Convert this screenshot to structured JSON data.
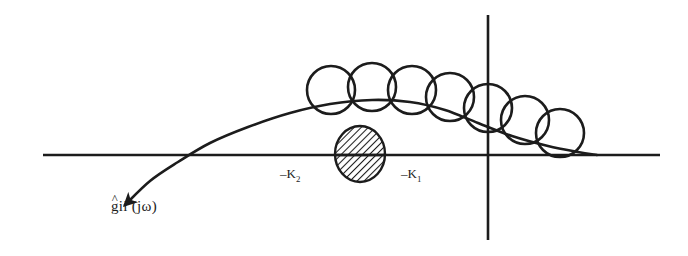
{
  "figure": {
    "background_color": "#ffffff",
    "ink_color": "#1c1c1c",
    "width": 688,
    "height": 256
  },
  "labels": {
    "response_curve": {
      "full_text": "ĝii (jω)",
      "hat": "^",
      "base": "g",
      "indices": "ii",
      "argument": " (jω)"
    },
    "gain_lower": {
      "full_text": "−K₂",
      "minus": "–",
      "symbol": "K",
      "subscript": "2"
    },
    "gain_upper": {
      "full_text": "−K₁",
      "minus": "–",
      "symbol": "K",
      "subscript": "1"
    }
  },
  "axes": {
    "horizontal": {
      "name": "real-axis",
      "x1": 43,
      "y1": 155,
      "x2": 660,
      "y2": 155,
      "stroke_width": 2.6
    },
    "vertical": {
      "name": "imaginary-axis",
      "x1": 488,
      "y1": 15,
      "x2": 488,
      "y2": 240,
      "stroke_width": 2.6
    }
  },
  "chart_data": {
    "type": "line",
    "title": "",
    "xlabel": "",
    "ylabel": "",
    "grid": false,
    "legend": "none",
    "response_curve": {
      "name": "ghat-ii-jomega",
      "stroke_width": 2.6,
      "arrow_end": "start",
      "points": [
        [
          125,
          205
        ],
        [
          150,
          181
        ],
        [
          178,
          162
        ],
        [
          210,
          143
        ],
        [
          248,
          127
        ],
        [
          290,
          113
        ],
        [
          330,
          104
        ],
        [
          372,
          100
        ],
        [
          410,
          102
        ],
        [
          445,
          110
        ],
        [
          478,
          123
        ],
        [
          512,
          136
        ],
        [
          548,
          146
        ],
        [
          578,
          152
        ],
        [
          597,
          155
        ]
      ],
      "arrow_tip": [
        125,
        205
      ],
      "arrow_size": 9
    },
    "uncertainty_circles": {
      "name": "uncertainty-disk-chain",
      "count": 7,
      "stroke_width": 2.6,
      "fill": "none",
      "circles": [
        {
          "cx": 331,
          "cy": 90,
          "r": 24
        },
        {
          "cx": 372,
          "cy": 87,
          "r": 24
        },
        {
          "cx": 412,
          "cy": 90,
          "r": 24
        },
        {
          "cx": 450,
          "cy": 97,
          "r": 24
        },
        {
          "cx": 488,
          "cy": 108,
          "r": 24
        },
        {
          "cx": 525,
          "cy": 120,
          "r": 24
        },
        {
          "cx": 560,
          "cy": 133,
          "r": 24
        }
      ]
    },
    "forbidden_disk": {
      "name": "hatched-sector-disk",
      "cx": 360,
      "cy": 154,
      "rx": 25,
      "ry": 28,
      "hatch_angle_deg": 45,
      "hatch_spacing": 5,
      "stroke_width": 2.4
    },
    "real_axis_markers": [
      {
        "label": "−K₂",
        "x": 293,
        "y": 155
      },
      {
        "label": "−K₁",
        "x": 412,
        "y": 155
      }
    ]
  }
}
